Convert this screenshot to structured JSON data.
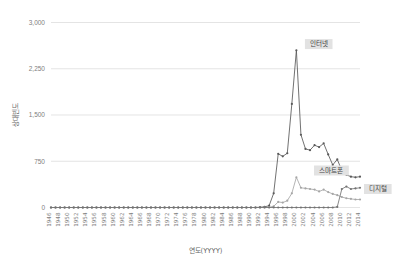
{
  "chart_data": {
    "type": "line",
    "title": "",
    "xlabel": "연도(YYYY)",
    "ylabel": "상대빈도",
    "ylim": [
      0,
      3000
    ],
    "yticks": [
      "0",
      "750",
      "1,500",
      "2,250",
      "3,000"
    ],
    "ytick_values": [
      0,
      750,
      1500,
      2250,
      3000
    ],
    "grid": true,
    "legend_position": "inline-right-of-series",
    "x_start": 1946,
    "x_end": 2014,
    "xtick_labels": [
      "1946",
      "1948",
      "1950",
      "1952",
      "1954",
      "1956",
      "1958",
      "1960",
      "1962",
      "1964",
      "1966",
      "1968",
      "1970",
      "1972",
      "1974",
      "1976",
      "1978",
      "1980",
      "1982",
      "1984",
      "1986",
      "1988",
      "1990",
      "1992",
      "1994",
      "1996",
      "1998",
      "2000",
      "2002",
      "2004",
      "2006",
      "2008",
      "2010",
      "2012",
      "2014"
    ],
    "x": [
      1946,
      1947,
      1948,
      1949,
      1950,
      1951,
      1952,
      1953,
      1954,
      1955,
      1956,
      1957,
      1958,
      1959,
      1960,
      1961,
      1962,
      1963,
      1964,
      1965,
      1966,
      1967,
      1968,
      1969,
      1970,
      1971,
      1972,
      1973,
      1974,
      1975,
      1976,
      1977,
      1978,
      1979,
      1980,
      1981,
      1982,
      1983,
      1984,
      1985,
      1986,
      1987,
      1988,
      1989,
      1990,
      1991,
      1992,
      1993,
      1994,
      1995,
      1996,
      1997,
      1998,
      1999,
      2000,
      2001,
      2002,
      2003,
      2004,
      2005,
      2006,
      2007,
      2008,
      2009,
      2010,
      2011,
      2012,
      2013,
      2014
    ],
    "series": [
      {
        "name": "인터넷",
        "color": "#595959",
        "marker": "circle",
        "label_x": 2001,
        "label_y": 2650,
        "values": [
          0,
          0,
          0,
          0,
          0,
          0,
          0,
          0,
          0,
          0,
          0,
          0,
          0,
          0,
          0,
          0,
          0,
          0,
          0,
          0,
          0,
          0,
          0,
          0,
          0,
          0,
          0,
          0,
          0,
          0,
          0,
          0,
          0,
          0,
          0,
          0,
          0,
          0,
          0,
          0,
          0,
          0,
          0,
          0,
          0,
          0,
          5,
          10,
          30,
          230,
          870,
          830,
          880,
          1680,
          2550,
          1180,
          950,
          930,
          1010,
          980,
          1040,
          860,
          690,
          780,
          600,
          530,
          500,
          490,
          500
        ]
      },
      {
        "name": "스마트폰",
        "color": "#a6a6a6",
        "marker": "circle",
        "label_x": 2003,
        "label_y": 600,
        "values": [
          0,
          0,
          0,
          0,
          0,
          0,
          0,
          0,
          0,
          0,
          0,
          0,
          0,
          0,
          0,
          0,
          0,
          0,
          0,
          0,
          0,
          0,
          0,
          0,
          0,
          0,
          0,
          0,
          0,
          0,
          0,
          0,
          0,
          0,
          0,
          0,
          0,
          0,
          0,
          0,
          0,
          0,
          0,
          0,
          0,
          0,
          0,
          0,
          5,
          20,
          90,
          80,
          110,
          230,
          490,
          320,
          310,
          300,
          290,
          260,
          290,
          250,
          220,
          200,
          170,
          150,
          140,
          130,
          130
        ]
      },
      {
        "name": "디지털",
        "color": "#737373",
        "marker": "circle",
        "label_x": 2014,
        "label_y": 300,
        "values": [
          0,
          0,
          0,
          0,
          0,
          0,
          0,
          0,
          0,
          0,
          0,
          0,
          0,
          0,
          0,
          0,
          0,
          0,
          0,
          0,
          0,
          0,
          0,
          0,
          0,
          0,
          0,
          0,
          0,
          0,
          0,
          0,
          0,
          0,
          0,
          0,
          0,
          0,
          0,
          0,
          0,
          0,
          0,
          0,
          0,
          0,
          0,
          0,
          0,
          0,
          0,
          0,
          0,
          0,
          0,
          0,
          0,
          0,
          0,
          0,
          0,
          0,
          0,
          10,
          300,
          340,
          300,
          310,
          320
        ]
      }
    ]
  }
}
